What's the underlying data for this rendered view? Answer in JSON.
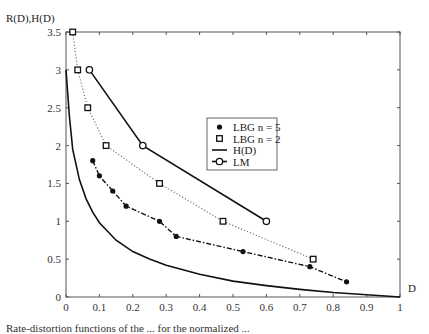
{
  "chart_data": {
    "type": "line",
    "title": "",
    "xlabel": "D",
    "ylabel": "R(D),H(D)",
    "xlim": [
      0,
      1
    ],
    "ylim": [
      0,
      3.5
    ],
    "xticks": [
      "0",
      "0.1",
      "0.2",
      "0.3",
      "0.4",
      "0.5",
      "0.6",
      "0.7",
      "0.8",
      "0.9",
      "1"
    ],
    "yticks": [
      "0",
      "0.5",
      "1",
      "1.5",
      "2",
      "2.5",
      "3",
      "3.5"
    ],
    "grid": false,
    "legend_position": "center",
    "series": [
      {
        "name": "LBG n = 5",
        "marker": "dot",
        "line": "dash-dot",
        "x": [
          0.08,
          0.1,
          0.14,
          0.18,
          0.28,
          0.33,
          0.53,
          0.73,
          0.84
        ],
        "y": [
          1.8,
          1.6,
          1.4,
          1.2,
          1.0,
          0.8,
          0.6,
          0.4,
          0.2
        ]
      },
      {
        "name": "LBG n = 2",
        "marker": "square",
        "line": "dotted",
        "x": [
          0.02,
          0.035,
          0.065,
          0.12,
          0.28,
          0.47,
          0.74
        ],
        "y": [
          3.5,
          3.0,
          2.5,
          2.0,
          1.5,
          1.0,
          0.5
        ]
      },
      {
        "name": "H(D)",
        "marker": "none",
        "line": "solid",
        "x": [
          0.0,
          0.01,
          0.02,
          0.04,
          0.06,
          0.08,
          0.1,
          0.15,
          0.2,
          0.25,
          0.3,
          0.4,
          0.5,
          0.6,
          0.7,
          0.8,
          0.9,
          1.0
        ],
        "y": [
          3.0,
          2.4,
          1.95,
          1.55,
          1.3,
          1.12,
          0.98,
          0.75,
          0.6,
          0.5,
          0.42,
          0.3,
          0.21,
          0.15,
          0.1,
          0.06,
          0.03,
          0.0
        ]
      },
      {
        "name": "LM",
        "marker": "circle",
        "line": "solid",
        "x": [
          0.07,
          0.23,
          0.6
        ],
        "y": [
          3.0,
          2.0,
          1.0
        ]
      }
    ]
  },
  "caption": "Rate-distortion functions of the ... for the normalized ..."
}
